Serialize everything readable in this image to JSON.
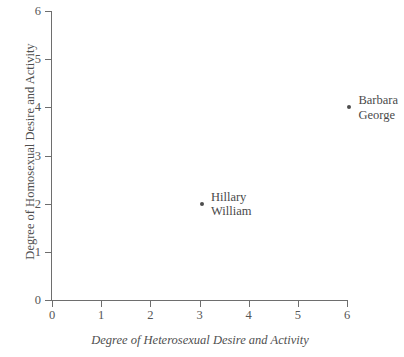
{
  "chart_data": {
    "type": "scatter",
    "title": "",
    "xlabel": "Degree of Heterosexual Desire and Activity",
    "ylabel": "Degree of Homosexual Desire and Activity",
    "xlim": [
      0,
      6
    ],
    "ylim": [
      0,
      6
    ],
    "xticks": [
      "0",
      "1",
      "2",
      "3",
      "4",
      "5",
      "6"
    ],
    "yticks": [
      "0",
      "1",
      "2",
      "3",
      "4",
      "5",
      "6"
    ],
    "grid": false,
    "legend": "none",
    "marker_color": "#4d4d4d",
    "axis_color": "#6e6e6e",
    "points": [
      {
        "x": 3.05,
        "y": 2,
        "labels": [
          "Hillary",
          "William"
        ]
      },
      {
        "x": 6.05,
        "y": 4,
        "labels": [
          "Barbara",
          "George"
        ]
      }
    ]
  }
}
